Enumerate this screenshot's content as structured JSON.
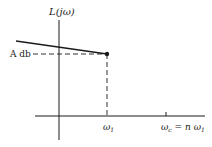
{
  "diagram": {
    "y_axis_label": "L(jω)",
    "level_label": "A db",
    "tick_labels": {
      "omega1": "ω",
      "omega1_sub": "1",
      "omegac_main": "ω",
      "omegac_sub": "c",
      "omegac_eq": " = n ω",
      "omegac_eq_sub": "1"
    },
    "elements": [
      "vertical axis",
      "horizontal axis",
      "solid sloped line ending at point (ω1, A db)",
      "dashed horizontal line from A db to point",
      "dashed vertical line from point to ω1",
      "tick at ωc = n ω1"
    ],
    "colors": {
      "ink": "#1a1a1a",
      "background": "#ffffff"
    }
  }
}
